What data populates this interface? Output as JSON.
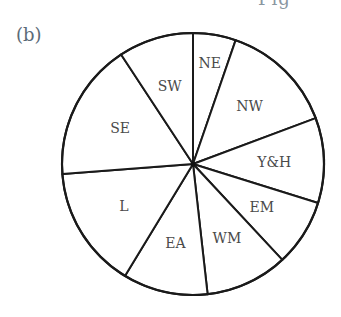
{
  "panel": {
    "label": "(b)",
    "cut_heading": "Fig"
  },
  "chart_data": {
    "type": "pie",
    "title": "",
    "start_angle_deg": 0,
    "direction": "clockwise",
    "center": [
      193,
      164
    ],
    "radius": 131,
    "categories": [
      "NE",
      "NW",
      "Y&H",
      "EM",
      "WM",
      "EA",
      "L",
      "SE",
      "SW"
    ],
    "values_degrees": [
      19.0,
      50.5,
      37.8,
      29.7,
      36.6,
      37.7,
      54.3,
      61.1,
      33.3
    ],
    "values_percent": [
      5.3,
      14.0,
      10.5,
      8.3,
      10.2,
      10.5,
      15.1,
      17.0,
      9.3
    ],
    "legend": "none (labels inside slices)",
    "fill_color": "#ffffff",
    "stroke_color": "#1a1a1a"
  }
}
